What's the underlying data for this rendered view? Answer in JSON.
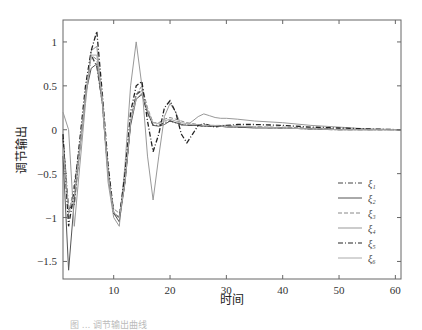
{
  "chart_data": {
    "type": "line",
    "title": "",
    "xlabel": "时间",
    "ylabel": "调节输出",
    "xlim": [
      1,
      61
    ],
    "ylim": [
      -1.7,
      1.25
    ],
    "xticks": [
      10,
      20,
      30,
      40,
      50,
      60
    ],
    "yticks": [
      -1.5,
      -1,
      -0.5,
      0,
      0.5,
      1
    ],
    "grid": false,
    "legend_position": "right-lower-inside",
    "x": [
      1,
      2,
      3,
      4,
      5,
      6,
      7,
      8,
      9,
      10,
      11,
      12,
      13,
      14,
      15,
      16,
      17,
      18,
      19,
      20,
      21,
      22,
      23,
      24,
      25,
      26,
      27,
      28,
      29,
      30,
      32,
      35,
      40,
      45,
      50,
      55,
      61
    ],
    "series": [
      {
        "name": "ξ1",
        "style": "dashdot",
        "color": "#444444",
        "values": [
          -0.1,
          -0.9,
          -0.85,
          -0.2,
          0.4,
          0.85,
          0.72,
          0.3,
          -0.5,
          -0.95,
          -1.0,
          -0.6,
          0.1,
          0.4,
          0.45,
          0.2,
          0.05,
          0.05,
          0.08,
          0.1,
          0.08,
          0.06,
          0.05,
          0.05,
          0.05,
          0.04,
          0.04,
          0.04,
          0.04,
          0.04,
          0.03,
          0.03,
          0.02,
          0.01,
          0.0,
          0.0,
          0.0
        ]
      },
      {
        "name": "ξ2",
        "style": "solid",
        "color": "#555555",
        "values": [
          -0.3,
          -1.6,
          -0.8,
          -0.2,
          0.4,
          0.7,
          0.75,
          0.3,
          -0.5,
          -0.95,
          -1.05,
          -0.6,
          0.05,
          0.35,
          0.4,
          0.2,
          0.05,
          0.04,
          0.06,
          0.1,
          0.08,
          0.06,
          0.05,
          0.05,
          0.05,
          0.04,
          0.04,
          0.04,
          0.04,
          0.03,
          0.03,
          0.02,
          0.02,
          0.01,
          0.0,
          0.0,
          0.0
        ]
      },
      {
        "name": "ξ3",
        "style": "dashed",
        "color": "#888888",
        "values": [
          -0.1,
          -1.0,
          -0.6,
          -0.2,
          0.4,
          0.85,
          0.8,
          0.3,
          -0.5,
          -0.9,
          -0.95,
          -0.6,
          0.1,
          0.4,
          0.5,
          0.25,
          0.08,
          0.08,
          0.12,
          0.14,
          0.12,
          0.1,
          0.08,
          0.07,
          0.06,
          0.06,
          0.05,
          0.05,
          0.05,
          0.05,
          0.04,
          0.03,
          0.03,
          0.02,
          0.01,
          0.0,
          0.0
        ]
      },
      {
        "name": "ξ4",
        "style": "solid",
        "color": "#999999",
        "values": [
          0.2,
          0.0,
          -1.1,
          -0.4,
          0.3,
          0.9,
          0.95,
          0.3,
          -0.6,
          -1.0,
          -1.1,
          -0.4,
          0.5,
          1.0,
          0.5,
          -0.3,
          -0.8,
          -0.3,
          0.15,
          0.3,
          0.2,
          0.05,
          0.05,
          0.1,
          0.15,
          0.18,
          0.16,
          0.14,
          0.13,
          0.13,
          0.12,
          0.1,
          0.08,
          0.05,
          0.03,
          0.01,
          0.0
        ]
      },
      {
        "name": "ξ5",
        "style": "dashdot",
        "color": "#222222",
        "values": [
          -0.05,
          -1.1,
          -0.7,
          -0.1,
          0.5,
          0.9,
          1.12,
          0.4,
          -0.4,
          -0.95,
          -1.0,
          -0.5,
          0.2,
          0.5,
          0.55,
          0.1,
          -0.25,
          -0.05,
          0.25,
          0.33,
          0.2,
          -0.05,
          -0.15,
          -0.05,
          0.05,
          0.07,
          0.05,
          0.03,
          0.04,
          0.05,
          0.06,
          0.06,
          0.05,
          0.03,
          0.02,
          0.01,
          0.0
        ]
      },
      {
        "name": "ξ6",
        "style": "solid",
        "color": "#aaaaaa",
        "values": [
          -0.2,
          -0.9,
          -0.75,
          -0.2,
          0.4,
          0.85,
          0.85,
          0.35,
          -0.5,
          -0.95,
          -1.0,
          -0.6,
          0.1,
          0.35,
          0.42,
          0.22,
          0.08,
          0.07,
          0.1,
          0.12,
          0.1,
          0.08,
          0.07,
          0.06,
          0.06,
          0.05,
          0.05,
          0.05,
          0.04,
          0.04,
          0.04,
          0.03,
          0.02,
          0.01,
          0.0,
          0.0,
          0.0
        ]
      }
    ]
  },
  "legend": {
    "items": [
      {
        "label": "ξ₁"
      },
      {
        "label": "ξ₂"
      },
      {
        "label": "ξ₃"
      },
      {
        "label": "ξ₄"
      },
      {
        "label": "ξ₅"
      },
      {
        "label": "ξ₆"
      }
    ]
  },
  "caption": "图 ...  调节输出曲线"
}
